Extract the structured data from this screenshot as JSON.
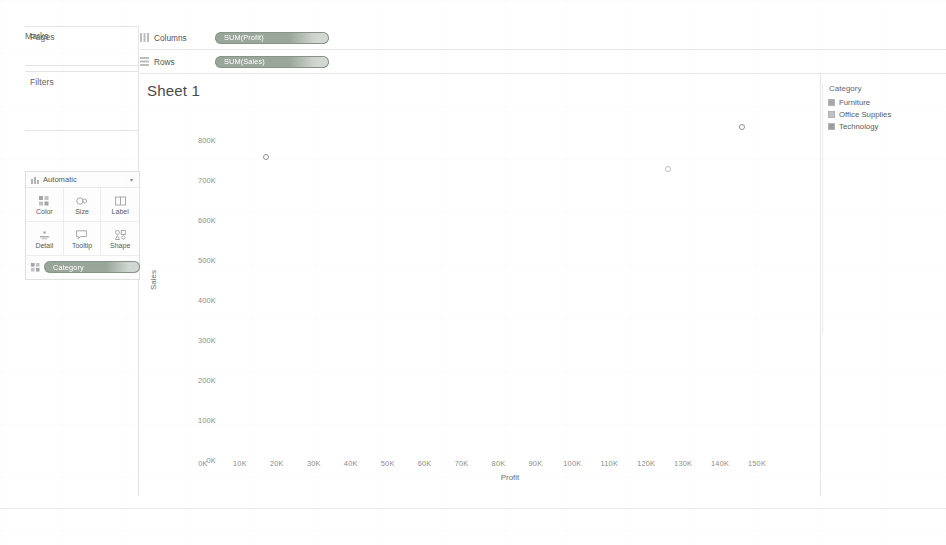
{
  "app": {
    "sheet_title": "Sheet 1"
  },
  "left_panel": {
    "pages_label": "Pages",
    "filters_label": "Filters",
    "marks_label": "Marks",
    "marks_type": {
      "label": "Automatic",
      "icon": "marks-type-icon",
      "caret": "▾"
    },
    "mark_buttons": [
      {
        "label": "Color",
        "icon": "color-icon"
      },
      {
        "label": "Size",
        "icon": "size-icon"
      },
      {
        "label": "Label",
        "icon": "label-icon"
      },
      {
        "label": "Detail",
        "icon": "detail-icon"
      },
      {
        "label": "Tooltip",
        "icon": "tooltip-icon"
      },
      {
        "label": "Shape",
        "icon": "shape-icon"
      }
    ],
    "marks_pill": {
      "label": "Category",
      "icon": "color-icon"
    }
  },
  "shelves": [
    {
      "name": "Columns",
      "icon": "columns-icon",
      "pill": "SUM(Profit)"
    },
    {
      "name": "Rows",
      "icon": "rows-icon",
      "pill": "SUM(Sales)"
    }
  ],
  "legend": {
    "title": "Category",
    "items": [
      {
        "label": "Furniture",
        "color": "#a8a8a8"
      },
      {
        "label": "Office Supplies",
        "color": "#c2c2c2"
      },
      {
        "label": "Technology",
        "color": "#9d9d9d"
      }
    ]
  },
  "colors": {
    "pill_background": "#9aa69a",
    "pill_text": "#ffffff",
    "axis_text": "#8c8c8c",
    "mark_outline": "#8f8f96"
  },
  "chart_data": {
    "type": "scatter",
    "title": "Sheet 1",
    "xlabel": "Profit",
    "ylabel": "Sales",
    "xlim": [
      0,
      155000
    ],
    "ylim": [
      0,
      830000
    ],
    "grid": false,
    "legend_position": "right",
    "x_ticks": [
      "0K",
      "10K",
      "20K",
      "30K",
      "40K",
      "50K",
      "60K",
      "70K",
      "80K",
      "90K",
      "100K",
      "110K",
      "120K",
      "130K",
      "140K",
      "150K"
    ],
    "x_tick_values": [
      0,
      10000,
      20000,
      30000,
      40000,
      50000,
      60000,
      70000,
      80000,
      90000,
      100000,
      110000,
      120000,
      130000,
      140000,
      150000
    ],
    "y_ticks": [
      "0K",
      "100K",
      "200K",
      "300K",
      "400K",
      "500K",
      "600K",
      "700K",
      "800K"
    ],
    "y_tick_values": [
      0,
      100000,
      200000,
      300000,
      400000,
      500000,
      600000,
      700000,
      800000
    ],
    "series": [
      {
        "name": "Furniture",
        "points": [
          {
            "x": 17000,
            "y": 757000
          }
        ]
      },
      {
        "name": "Office Supplies",
        "points": [
          {
            "x": 126000,
            "y": 727000
          }
        ]
      },
      {
        "name": "Technology",
        "points": [
          {
            "x": 146000,
            "y": 832000
          }
        ]
      }
    ]
  }
}
